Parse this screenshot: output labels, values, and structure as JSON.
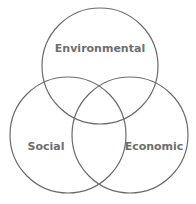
{
  "diagram": {
    "type": "venn",
    "sets": [
      {
        "label": "Environmental"
      },
      {
        "label": "Social"
      },
      {
        "label": "Economic"
      }
    ],
    "stroke_color": "#6b6b6b",
    "text_color": "#6e6e6e"
  }
}
